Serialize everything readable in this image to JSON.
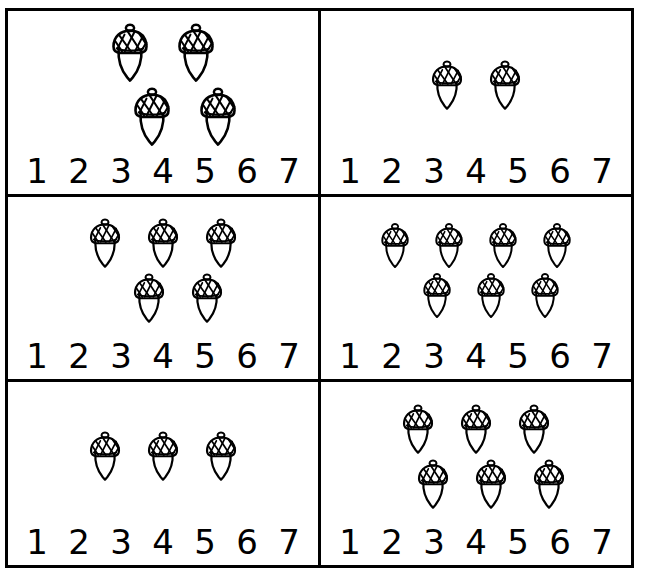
{
  "worksheet": {
    "title": "Count the acorns",
    "object_name": "acorn",
    "background_color": "#ffffff",
    "line_color": "#000000",
    "border_width_px": 3,
    "number_choices": [
      "1",
      "2",
      "3",
      "4",
      "5",
      "6",
      "7"
    ],
    "footer_credit": ""
  },
  "cells": [
    {
      "id": "cell-1",
      "position": "top-left",
      "acorn_count": 4,
      "rows": [
        2,
        2
      ],
      "row_offsets": [
        "none",
        "indent-right"
      ],
      "size": "large",
      "numbers": [
        "1",
        "2",
        "3",
        "4",
        "5",
        "6",
        "7"
      ]
    },
    {
      "id": "cell-2",
      "position": "top-right",
      "acorn_count": 2,
      "rows": [
        2
      ],
      "row_offsets": [
        "none"
      ],
      "size": "small",
      "numbers": [
        "1",
        "2",
        "3",
        "4",
        "5",
        "6",
        "7"
      ]
    },
    {
      "id": "cell-3",
      "position": "middle-left",
      "acorn_count": 5,
      "rows": [
        3,
        2
      ],
      "row_offsets": [
        "none",
        "indent-right-small"
      ],
      "size": "small",
      "numbers": [
        "1",
        "2",
        "3",
        "4",
        "5",
        "6",
        "7"
      ]
    },
    {
      "id": "cell-4",
      "position": "middle-right",
      "acorn_count": 7,
      "rows": [
        4,
        3
      ],
      "row_offsets": [
        "none",
        "indent-right-small"
      ],
      "size": "tiny",
      "numbers": [
        "1",
        "2",
        "3",
        "4",
        "5",
        "6",
        "7"
      ]
    },
    {
      "id": "cell-5",
      "position": "bottom-left",
      "acorn_count": 3,
      "rows": [
        3
      ],
      "row_offsets": [
        "none"
      ],
      "size": "small",
      "numbers": [
        "1",
        "2",
        "3",
        "4",
        "5",
        "6",
        "7"
      ]
    },
    {
      "id": "cell-6",
      "position": "bottom-right",
      "acorn_count": 6,
      "rows": [
        3,
        3
      ],
      "row_offsets": [
        "none",
        "indent-right-small"
      ],
      "size": "small",
      "numbers": [
        "1",
        "2",
        "3",
        "4",
        "5",
        "6",
        "7"
      ]
    }
  ]
}
